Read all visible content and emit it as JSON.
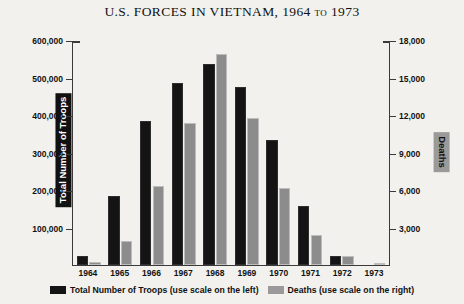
{
  "chart_data": {
    "type": "bar",
    "title": "U.S. FORCES IN VIETNAM, 1964 to 1973",
    "xlabel": "",
    "categories": [
      "1964",
      "1965",
      "1966",
      "1967",
      "1968",
      "1969",
      "1970",
      "1971",
      "1972",
      "1973"
    ],
    "series": [
      {
        "name": "Total Number of Troops",
        "axis": "left",
        "color": "#141414",
        "values": [
          23300,
          184300,
          385300,
          485600,
          536100,
          475200,
          334600,
          156800,
          24200,
          0
        ]
      },
      {
        "name": "Deaths",
        "axis": "right",
        "color": "#8c8c8c",
        "values": [
          216,
          1928,
          6350,
          11363,
          16899,
          11780,
          6173,
          2414,
          759,
          68
        ]
      }
    ],
    "left_axis": {
      "label": "Total Number of Troops",
      "ticks": [
        "600,000",
        "500,000",
        "400,000",
        "300,000",
        "200,000",
        "100,000"
      ],
      "ylim": [
        0,
        600000
      ]
    },
    "right_axis": {
      "label": "Deaths",
      "ticks": [
        "18,000",
        "15,000",
        "12,000",
        "9,000",
        "6,000",
        "3,000"
      ],
      "ylim": [
        0,
        18000
      ]
    },
    "grid": false,
    "legend_position": "bottom",
    "legend": [
      {
        "label": "Total Number of Troops (use scale on the left)",
        "color": "#141414"
      },
      {
        "label": "Deaths (use scale on the right)",
        "color": "#9a9a9a"
      }
    ]
  }
}
